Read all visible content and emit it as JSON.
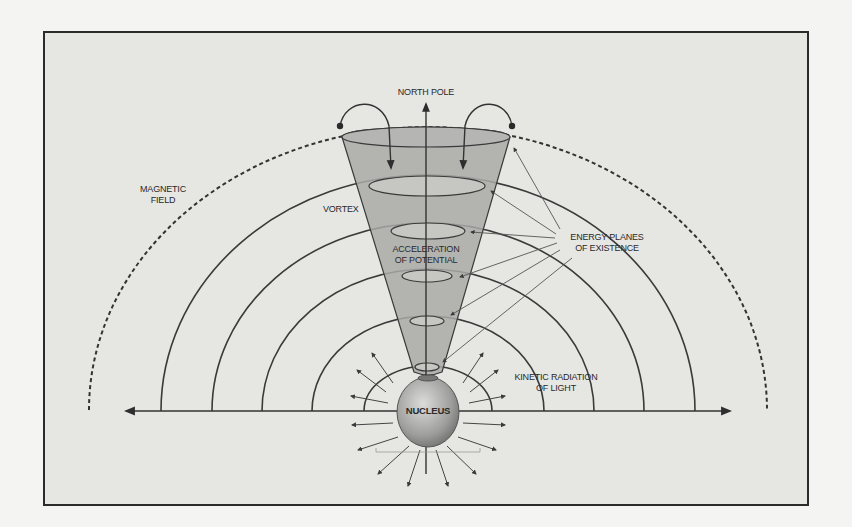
{
  "diagram": {
    "labels": {
      "north_pole": "NORTH POLE",
      "magnetic_field_1": "MAGNETIC",
      "magnetic_field_2": "FIELD",
      "vortex": "VORTEX",
      "acceleration_1": "ACCELERATION",
      "acceleration_2": "OF POTENTIAL",
      "energy_planes_1": "ENERGY PLANES",
      "energy_planes_2": "OF EXISTENCE",
      "kinetic_1": "KINETIC RADIATION",
      "kinetic_2": "OF LIGHT",
      "nucleus": "NUCLEUS"
    },
    "colors": {
      "background": "#f4f4f2",
      "panel": "#e6e6e3",
      "frame": "#2b2b2b",
      "line": "#3a3a3a",
      "cone_fill": "#a8a8a6",
      "ellipse_fill": "#c8c8c5",
      "sphere_light": "#d8d8d6",
      "sphere_dark": "#7d7d7b"
    }
  }
}
